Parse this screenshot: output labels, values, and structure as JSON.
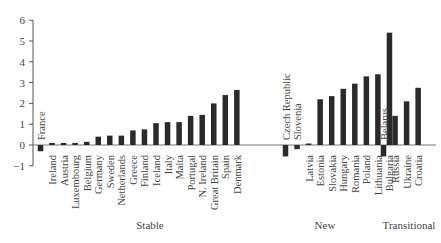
{
  "chart_data": {
    "type": "bar",
    "title": "",
    "xlabel": "",
    "ylabel": "",
    "ylim": [
      -1,
      6
    ],
    "yticks": [
      -1,
      0,
      1,
      2,
      3,
      4,
      5,
      6
    ],
    "grid": false,
    "legend": null,
    "groups": [
      {
        "name": "Stable",
        "categories": [
          "France",
          "Ireland",
          "Austria",
          "Luxembourg",
          "Belgium",
          "Germany",
          "Sweden",
          "Netherlands",
          "Greece",
          "Finland",
          "Iceland",
          "Italy",
          "Malta",
          "Portugal",
          "N. Ireland",
          "Great Britain",
          "Spain",
          "Denmark"
        ],
        "values": [
          -0.3,
          0.1,
          0.1,
          0.1,
          0.15,
          0.4,
          0.45,
          0.45,
          0.7,
          0.75,
          1.05,
          1.1,
          1.1,
          1.4,
          1.45,
          2.0,
          2.4,
          2.65
        ]
      },
      {
        "name": "New",
        "categories": [
          "Czech Republic",
          "Slovenia",
          "Latvia",
          "Estonia",
          "Slovakia",
          "Hungary",
          "Romania",
          "Poland",
          "Lithuania",
          "Bulgaria"
        ],
        "values": [
          -0.55,
          -0.2,
          0.05,
          2.2,
          2.35,
          2.7,
          2.95,
          3.3,
          3.4,
          5.4
        ]
      },
      {
        "name": "Transitional",
        "categories": [
          "Belarus",
          "Russia",
          "Ukraine",
          "Croatia"
        ],
        "values": [
          -0.55,
          1.4,
          2.1,
          2.75
        ]
      }
    ],
    "label_above_baseline": [
      "France",
      "Czech Republic",
      "Slovenia",
      "Belarus"
    ]
  }
}
